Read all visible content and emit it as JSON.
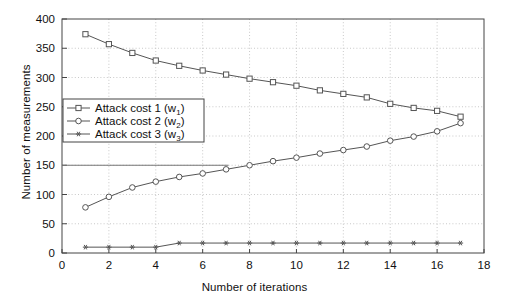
{
  "chart_data": {
    "type": "line",
    "title": "",
    "xlabel": "Number of iterations",
    "ylabel": "Number of measurements",
    "xlim": [
      0,
      18
    ],
    "ylim": [
      0,
      400
    ],
    "xticks": [
      0,
      2,
      4,
      6,
      8,
      10,
      12,
      14,
      16,
      18
    ],
    "yticks": [
      0,
      50,
      100,
      150,
      200,
      250,
      300,
      350,
      400
    ],
    "xtick_labels": [
      "0",
      "2",
      "4",
      "6",
      "8",
      "10",
      "12",
      "14",
      "16",
      "18"
    ],
    "ytick_labels": [
      "0",
      "50",
      "100",
      "150",
      "200",
      "250",
      "300",
      "350",
      "400"
    ],
    "grid": true,
    "grid_style": "dotted",
    "legend_position": "center left",
    "x": [
      1,
      2,
      3,
      4,
      5,
      6,
      7,
      8,
      9,
      10,
      11,
      12,
      13,
      14,
      15,
      16,
      17
    ],
    "series": [
      {
        "name": "Attack cost 1 (w1)",
        "label_main": "Attack cost 1 (w",
        "label_sub": "1",
        "label_tail": ")",
        "marker": "square-open",
        "color": "#555555",
        "values": [
          374,
          357,
          342,
          329,
          320,
          312,
          305,
          298,
          292,
          286,
          278,
          272,
          266,
          255,
          248,
          243,
          233
        ]
      },
      {
        "name": "Attack cost 2 (w2)",
        "label_main": "Attack cost 2 (w",
        "label_sub": "2",
        "label_tail": ")",
        "marker": "circle-open",
        "color": "#555555",
        "values": [
          78,
          96,
          112,
          122,
          130,
          136,
          143,
          150,
          157,
          163,
          170,
          176,
          182,
          192,
          199,
          208,
          222
        ]
      },
      {
        "name": "Attack cost 3 (w3)",
        "label_main": "Attack cost 3 (w",
        "label_sub": "3",
        "label_tail": ")",
        "marker": "star",
        "color": "#555555",
        "values": [
          10,
          10,
          10,
          10,
          17,
          17,
          17,
          17,
          17,
          17,
          17,
          17,
          17,
          17,
          17,
          17,
          17
        ]
      }
    ],
    "annotations": [
      {
        "name": "reference-line-150",
        "type": "hline-segment",
        "y": 150,
        "x_start": 0,
        "x_end": 7.1,
        "color": "#777777"
      }
    ]
  }
}
